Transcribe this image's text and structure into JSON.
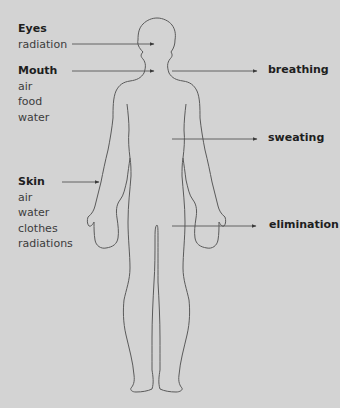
{
  "diagram": {
    "colors": {
      "background": "#d3d3d3",
      "line": "#555555",
      "text": "#2a2a2a"
    },
    "inputs": [
      {
        "id": "eyes",
        "label": "Eyes",
        "items": [
          "radiation"
        ]
      },
      {
        "id": "mouth",
        "label": "Mouth",
        "items": [
          "air",
          "food",
          "water"
        ]
      },
      {
        "id": "skin",
        "label": "Skin",
        "items": [
          "air",
          "water",
          "clothes",
          "radiations"
        ]
      }
    ],
    "outputs": [
      {
        "id": "breathing",
        "label": "breathing"
      },
      {
        "id": "sweating",
        "label": "sweating"
      },
      {
        "id": "elimination",
        "label": "elimination"
      }
    ]
  }
}
